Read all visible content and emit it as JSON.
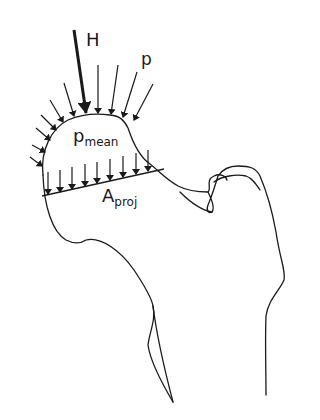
{
  "figure": {
    "labels": {
      "hip_force": "H",
      "pressure": "p",
      "mean_pressure_main": "p",
      "mean_pressure_sub": "mean",
      "projected_area_main": "A",
      "projected_area_sub": "proj"
    },
    "colors": {
      "stroke": "#1a1a1a",
      "background": "#ffffff"
    }
  }
}
